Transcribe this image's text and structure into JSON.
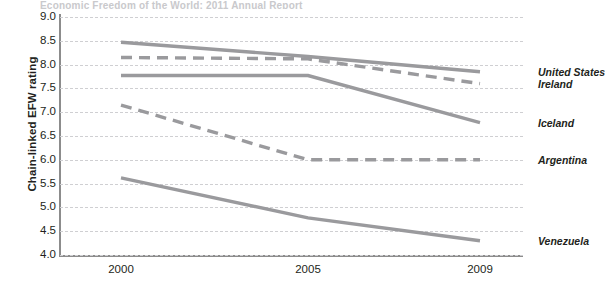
{
  "title_strip": "Economic Freedom of the World: 2011 Annual Report",
  "axes": {
    "ylabel": "Chain-linked EFW rating",
    "xlabel": "",
    "yticks": [
      "9.0",
      "8.5",
      "8.0",
      "7.5",
      "7.0",
      "6.5",
      "6.0",
      "5.5",
      "5.0",
      "4.5",
      "4.0"
    ],
    "xticks": [
      "2000",
      "2005",
      "2009"
    ]
  },
  "colors": {
    "line": "#9a9a9d",
    "grid": "#cfcfd2",
    "axis": "#8c8c8c",
    "text": "#231f20"
  },
  "chart_data": {
    "type": "line",
    "title": "",
    "xlabel": "",
    "ylabel": "Chain-linked EFW rating",
    "x": [
      2000,
      2005,
      2009
    ],
    "categories": [
      "2000",
      "2005",
      "2009"
    ],
    "ylim": [
      4.0,
      9.0
    ],
    "ytick_step": 0.5,
    "grid": true,
    "legend": "inline-right-labels",
    "series": [
      {
        "name": "United States",
        "values": [
          8.47,
          8.17,
          7.85
        ],
        "style": "solid"
      },
      {
        "name": "Ireland",
        "values": [
          8.15,
          8.12,
          7.6
        ],
        "style": "dashed"
      },
      {
        "name": "Iceland",
        "values": [
          7.77,
          7.77,
          6.78
        ],
        "style": "solid"
      },
      {
        "name": "Argentina",
        "values": [
          7.15,
          6.0,
          6.0
        ],
        "style": "dashed"
      },
      {
        "name": "Venezuela",
        "values": [
          5.62,
          4.78,
          4.3
        ],
        "style": "solid"
      }
    ]
  }
}
